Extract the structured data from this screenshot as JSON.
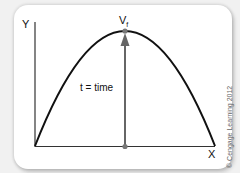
{
  "diagram": {
    "axis_y_label": "Y",
    "axis_x_label": "X",
    "peak_label": "V",
    "peak_label_sub": "f",
    "arrow_label": "t = time",
    "copyright": "© Cengage Learning 2012",
    "colors": {
      "curve": "#111111",
      "arrow": "#666666",
      "axis": "#333333",
      "card": "#ffffff"
    }
  }
}
